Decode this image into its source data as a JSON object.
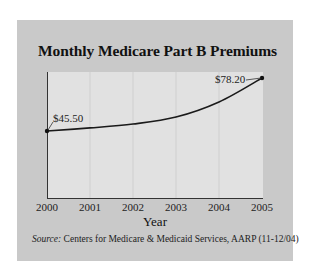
{
  "colors": {
    "panel_bg": "#c9c9c9",
    "plot_bg": "#e1e1e1",
    "gridline": "#cfcfcf",
    "axis": "#333333",
    "line": "#1a1a1a"
  },
  "chart_data": {
    "type": "line",
    "title": "Monthly Medicare Part B Premiums",
    "xlabel": "Year",
    "ylabel": "",
    "categories": [
      "2000",
      "2001",
      "2002",
      "2003",
      "2004",
      "2005"
    ],
    "series": [
      {
        "name": "Monthly Part B premium ($)",
        "values": [
          45.5,
          47.4,
          49.8,
          54.1,
          63.4,
          78.2
        ]
      }
    ],
    "annotations": [
      {
        "x": "2000",
        "label": "$45.50"
      },
      {
        "x": "2005",
        "label": "$78.20"
      }
    ],
    "y_axis_ticks_shown": false,
    "grid": "vertical",
    "legend": "none",
    "source": "Centers for Medicare & Medicaid Services, AARP (11-12/04)"
  },
  "chart": {
    "title": "Monthly Medicare Part B Premiums",
    "xlabel": "Year",
    "ticks": [
      "2000",
      "2001",
      "2002",
      "2003",
      "2004",
      "2005"
    ],
    "label_start": "$45.50",
    "label_end": "$78.20",
    "source_key": "Source:",
    "source_text": " Centers for Medicare & Medicaid Services, AARP (11-12/04)"
  }
}
